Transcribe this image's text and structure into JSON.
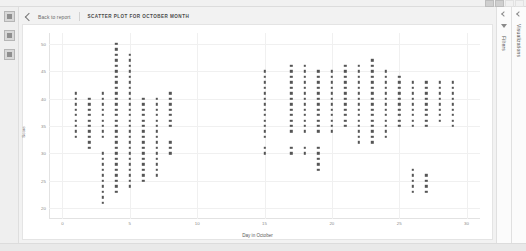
{
  "window": {
    "controls": [
      "minimize-button",
      "maximize-button",
      "spacer",
      "close-button"
    ]
  },
  "left_rail": {
    "items": [
      {
        "name": "nav-icon-1",
        "label": ""
      },
      {
        "name": "nav-icon-2",
        "label": ""
      },
      {
        "name": "nav-icon-3",
        "label": ""
      }
    ]
  },
  "breadcrumb": {
    "back_label": "Back to report",
    "report_title": "SCATTER PLOT FOR OCTOBER MONTH"
  },
  "right_panels": [
    {
      "name": "visualizations-panel",
      "label": "Visualizations",
      "icon": "chevron-icon"
    },
    {
      "name": "filters-panel",
      "label": "Filters",
      "icon": "funnel-icon"
    }
  ],
  "chart_data": {
    "type": "scatter",
    "title": "SCATTER PLOT FOR OCTOBER MONTH",
    "xlabel": "Day in October",
    "ylabel": "Score",
    "xlim": [
      -1,
      31
    ],
    "ylim": [
      18,
      52
    ],
    "xticks": [
      0,
      5,
      10,
      15,
      20,
      25,
      30
    ],
    "yticks": [
      20,
      25,
      30,
      35,
      40,
      45,
      50
    ],
    "grid": true,
    "legend": "none",
    "marker_color": "#555555",
    "columns": [
      {
        "x": 1,
        "y_values": [
          41,
          40,
          39,
          38,
          37,
          36,
          35,
          34,
          33
        ]
      },
      {
        "x": 2,
        "y_values": [
          40,
          39,
          38,
          37,
          36,
          35,
          34,
          33,
          32,
          31
        ]
      },
      {
        "x": 3,
        "y_values": [
          41,
          40,
          39,
          38,
          37,
          36,
          35,
          34,
          33,
          30,
          29,
          28,
          27,
          26,
          25,
          24,
          23,
          22,
          21
        ]
      },
      {
        "x": 4,
        "y_values": [
          50,
          49,
          48,
          47,
          46,
          45,
          44,
          43,
          42,
          41,
          40,
          39,
          38,
          37,
          36,
          35,
          34,
          33,
          32,
          31,
          30,
          29,
          28,
          27,
          26,
          25,
          24,
          23
        ]
      },
      {
        "x": 5,
        "y_values": [
          48,
          47,
          46,
          45,
          44,
          43,
          42,
          41,
          40,
          39,
          38,
          37,
          36,
          35,
          34,
          33,
          32,
          31,
          30,
          29,
          28,
          27,
          26,
          25,
          24
        ]
      },
      {
        "x": 6,
        "y_values": [
          40,
          39,
          38,
          37,
          36,
          35,
          34,
          33,
          32,
          31,
          30,
          29,
          28,
          27,
          26,
          25
        ]
      },
      {
        "x": 7,
        "y_values": [
          40,
          39,
          38,
          37,
          36,
          35,
          34,
          33,
          32,
          31,
          30,
          29,
          28,
          27,
          26
        ]
      },
      {
        "x": 8,
        "y_values": [
          41,
          40,
          39,
          38,
          37,
          36,
          35,
          32,
          31,
          30
        ]
      },
      {
        "x": 15,
        "y_values": [
          45,
          44,
          43,
          42,
          41,
          40,
          39,
          38,
          37,
          36,
          35,
          34,
          33,
          31,
          30
        ]
      },
      {
        "x": 17,
        "y_values": [
          46,
          45,
          44,
          43,
          42,
          41,
          40,
          39,
          38,
          37,
          36,
          35,
          34,
          31,
          30
        ]
      },
      {
        "x": 18,
        "y_values": [
          46,
          45,
          44,
          43,
          42,
          41,
          40,
          39,
          38,
          37,
          36,
          35,
          34,
          31,
          30
        ]
      },
      {
        "x": 19,
        "y_values": [
          45,
          44,
          43,
          42,
          41,
          40,
          39,
          38,
          37,
          36,
          35,
          34,
          31,
          30,
          29,
          28,
          27
        ]
      },
      {
        "x": 20,
        "y_values": [
          45,
          44,
          43,
          42,
          41,
          40,
          39,
          38,
          37,
          36,
          35,
          34
        ]
      },
      {
        "x": 21,
        "y_values": [
          46,
          45,
          44,
          43,
          42,
          41,
          40,
          39,
          38,
          37,
          36,
          35
        ]
      },
      {
        "x": 22,
        "y_values": [
          46,
          45,
          44,
          43,
          42,
          41,
          40,
          39,
          38,
          37,
          36,
          35,
          34,
          33,
          32
        ]
      },
      {
        "x": 23,
        "y_values": [
          47,
          46,
          45,
          44,
          43,
          42,
          41,
          40,
          39,
          38,
          37,
          36,
          35,
          34,
          33,
          32
        ]
      },
      {
        "x": 24,
        "y_values": [
          45,
          44,
          43,
          42,
          41,
          40,
          39,
          38,
          37,
          36,
          35,
          34,
          33
        ]
      },
      {
        "x": 25,
        "y_values": [
          44,
          43,
          42,
          41,
          40,
          39,
          38,
          37,
          36,
          35
        ]
      },
      {
        "x": 26,
        "y_values": [
          43,
          42,
          41,
          40,
          39,
          38,
          37,
          36,
          35,
          27,
          26,
          25,
          24,
          23
        ]
      },
      {
        "x": 27,
        "y_values": [
          43,
          42,
          41,
          40,
          39,
          38,
          37,
          36,
          35,
          26,
          25,
          24,
          23
        ]
      },
      {
        "x": 28,
        "y_values": [
          43,
          42,
          41,
          40,
          39,
          38,
          37,
          36
        ]
      },
      {
        "x": 29,
        "y_values": [
          43,
          42,
          41,
          40,
          39,
          38,
          37,
          36,
          35
        ]
      }
    ]
  }
}
